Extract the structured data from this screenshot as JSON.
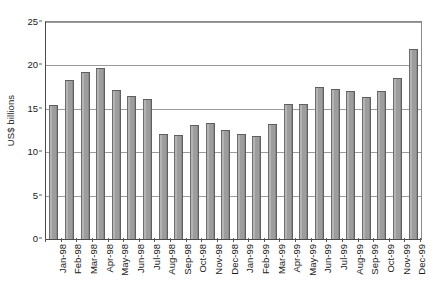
{
  "chart_data": {
    "type": "bar",
    "title": "",
    "xlabel": "",
    "ylabel": "US$ billions",
    "ylim": [
      0,
      25
    ],
    "yticks": [
      0,
      5,
      10,
      15,
      20,
      25
    ],
    "ytick_labels": [
      "0",
      "5",
      "10",
      "15",
      "20",
      "25"
    ],
    "grid": true,
    "legend": "none",
    "categories": [
      "Jan-98",
      "Feb-98",
      "Mar-98",
      "Apr-98",
      "May-98",
      "Jun-98",
      "Jul-98",
      "Aug-98",
      "Sep-98",
      "Oct-98",
      "Nov-98",
      "Dec-98",
      "Jan-99",
      "Feb-99",
      "Mar-99",
      "Apr-99",
      "May-99",
      "Jun-99",
      "Jul-99",
      "Aug-99",
      "Sep-99",
      "Oct-99",
      "Nov-99",
      "Dec-99"
    ],
    "values": [
      15.4,
      18.3,
      19.2,
      19.7,
      17.2,
      16.5,
      16.1,
      12.1,
      12.0,
      13.1,
      13.4,
      12.6,
      12.1,
      11.9,
      13.3,
      15.6,
      15.6,
      17.5,
      17.3,
      17.0,
      16.4,
      17.0,
      18.5,
      21.9
    ],
    "bar_color": "#9d9d9d",
    "bar_edge_color": "#5f5f5f",
    "gridline_color": "#9b9b9b",
    "axis_color": "#4a4a4a",
    "text_color": "#1a1a1a",
    "background": "#ffffff"
  }
}
